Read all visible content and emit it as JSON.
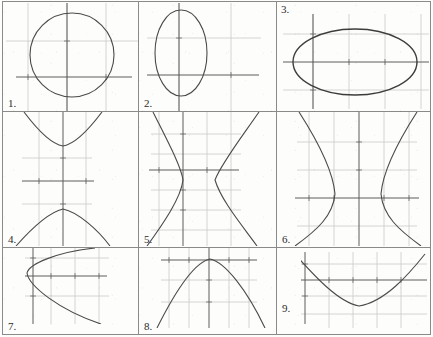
{
  "page": {
    "kind": "worksheet-graph-grid",
    "rows": 3,
    "columns": 3,
    "background_color": "#fdfdfc",
    "border_color": "#8a8a8a",
    "axis_color": "#5c5c5c",
    "grid_color": "#c9c9c9",
    "curve_color": "#4a4a4a"
  },
  "panels": [
    {
      "number": "1.",
      "label_position": "bottom-left",
      "graph": {
        "type": "circle",
        "curve": "circle",
        "center": [
          0.25,
          0.0
        ],
        "radius_x": 2.0,
        "radius_y": 2.0,
        "x_range": [
          -3,
          3
        ],
        "y_range": [
          -2.6,
          2.6
        ],
        "grid": true,
        "axes": true
      }
    },
    {
      "number": "2.",
      "label_position": "bottom-left",
      "graph": {
        "type": "ellipse",
        "curve": "vertical-ellipse",
        "center": [
          0.0,
          0.1
        ],
        "radius_x": 1.2,
        "radius_y": 2.3,
        "x_range": [
          -3,
          3
        ],
        "y_range": [
          -2.8,
          2.8
        ],
        "grid": true,
        "axes": true
      }
    },
    {
      "number": "3.",
      "label_position": "top-left",
      "graph": {
        "type": "ellipse",
        "curve": "horizontal-ellipse",
        "center": [
          0.1,
          0.0
        ],
        "radius_x": 3.1,
        "radius_y": 1.9,
        "x_range": [
          -4,
          4
        ],
        "y_range": [
          -2.6,
          2.6
        ],
        "grid": true,
        "axes": true
      }
    },
    {
      "number": "4.",
      "label_position": "bottom-left",
      "graph": {
        "type": "hyperbola",
        "curve": "vertical-hyperbola",
        "center": [
          0.0,
          0.0
        ],
        "a": 1.05,
        "b": 1.35,
        "opens": "up-down",
        "x_range": [
          -3.2,
          3.2
        ],
        "y_range": [
          -3.2,
          3.2
        ],
        "grid": true,
        "axes": true
      }
    },
    {
      "number": "5.",
      "label_position": "bottom-left",
      "graph": {
        "type": "hyperbola",
        "curve": "horizontal-hyperbola",
        "center": [
          0.15,
          -0.2
        ],
        "a": 0.85,
        "b": 1.5,
        "opens": "left-right",
        "x_range": [
          -3.2,
          3.2
        ],
        "y_range": [
          -3.4,
          3.4
        ],
        "grid": true,
        "axes": true
      }
    },
    {
      "number": "6.",
      "label_position": "bottom-left",
      "graph": {
        "type": "hyperbola",
        "curve": "horizontal-hyperbola",
        "center": [
          0.0,
          0.0
        ],
        "a": 1.25,
        "b": 1.6,
        "opens": "left-right",
        "x_range": [
          -3.4,
          3.4
        ],
        "y_range": [
          -3.2,
          3.2
        ],
        "grid": true,
        "axes": true
      }
    },
    {
      "number": "7.",
      "label_position": "bottom-left",
      "graph": {
        "type": "parabola",
        "curve": "rightward-parabola",
        "vertex": [
          -1.3,
          0.55
        ],
        "opens": "right",
        "coefficient": 0.55,
        "x_range": [
          -2.6,
          3.4
        ],
        "y_range": [
          -2.2,
          2.2
        ],
        "grid": true,
        "axes": true
      }
    },
    {
      "number": "8.",
      "label_position": "bottom-left",
      "graph": {
        "type": "parabola",
        "curve": "downward-parabola",
        "vertex": [
          0.05,
          1.55
        ],
        "opens": "down",
        "coefficient": -0.62,
        "x_range": [
          -3.2,
          3.2
        ],
        "y_range": [
          -2.4,
          2.0
        ],
        "grid": true,
        "axes": true
      }
    },
    {
      "number": "9.",
      "label_position": "middle-left",
      "graph": {
        "type": "parabola",
        "curve": "upward-parabola",
        "vertex": [
          1.45,
          -1.15
        ],
        "opens": "up",
        "coefficient": 0.5,
        "x_range": [
          -1.4,
          4.6
        ],
        "y_range": [
          -1.9,
          1.7
        ],
        "grid": true,
        "axes": true
      }
    }
  ]
}
